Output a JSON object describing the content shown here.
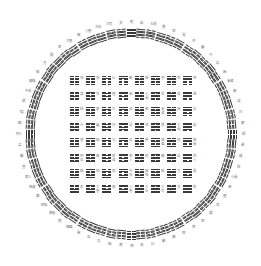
{
  "diagram": {
    "center": [
      131,
      134
    ],
    "ring_radius": 101,
    "label_radius": 112,
    "colors": {
      "line": "#3a3a3a",
      "label": "#777777",
      "background": "#ffffff"
    }
  },
  "hexagrams_fuxi": [
    {
      "name": "乾",
      "bits": "111111"
    },
    {
      "name": "夬",
      "bits": "111110"
    },
    {
      "name": "大有",
      "bits": "111101"
    },
    {
      "name": "大壯",
      "bits": "111100"
    },
    {
      "name": "小畜",
      "bits": "111011"
    },
    {
      "name": "需",
      "bits": "111010"
    },
    {
      "name": "大畜",
      "bits": "111001"
    },
    {
      "name": "泰",
      "bits": "111000"
    },
    {
      "name": "履",
      "bits": "110111"
    },
    {
      "name": "兌",
      "bits": "110110"
    },
    {
      "name": "睽",
      "bits": "110101"
    },
    {
      "name": "歸妹",
      "bits": "110100"
    },
    {
      "name": "中孚",
      "bits": "110011"
    },
    {
      "name": "節",
      "bits": "110010"
    },
    {
      "name": "損",
      "bits": "110001"
    },
    {
      "name": "臨",
      "bits": "110000"
    },
    {
      "name": "同人",
      "bits": "101111"
    },
    {
      "name": "革",
      "bits": "101110"
    },
    {
      "name": "離",
      "bits": "101101"
    },
    {
      "name": "豐",
      "bits": "101100"
    },
    {
      "name": "家人",
      "bits": "101011"
    },
    {
      "name": "既濟",
      "bits": "101010"
    },
    {
      "name": "賁",
      "bits": "101001"
    },
    {
      "name": "明夷",
      "bits": "101000"
    },
    {
      "name": "無妄",
      "bits": "100111"
    },
    {
      "name": "隨",
      "bits": "100110"
    },
    {
      "name": "噬嗑",
      "bits": "100101"
    },
    {
      "name": "震",
      "bits": "100100"
    },
    {
      "name": "益",
      "bits": "100011"
    },
    {
      "name": "屯",
      "bits": "100010"
    },
    {
      "name": "頤",
      "bits": "100001"
    },
    {
      "name": "復",
      "bits": "100000"
    },
    {
      "name": "姤",
      "bits": "011111"
    },
    {
      "name": "大過",
      "bits": "011110"
    },
    {
      "name": "鼎",
      "bits": "011101"
    },
    {
      "name": "恆",
      "bits": "011100"
    },
    {
      "name": "巽",
      "bits": "011011"
    },
    {
      "name": "井",
      "bits": "011010"
    },
    {
      "name": "蠱",
      "bits": "011001"
    },
    {
      "name": "升",
      "bits": "011000"
    },
    {
      "name": "訟",
      "bits": "010111"
    },
    {
      "name": "困",
      "bits": "010110"
    },
    {
      "name": "未濟",
      "bits": "010101"
    },
    {
      "name": "解",
      "bits": "010100"
    },
    {
      "name": "渙",
      "bits": "010011"
    },
    {
      "name": "坎",
      "bits": "010010"
    },
    {
      "name": "蒙",
      "bits": "010001"
    },
    {
      "name": "師",
      "bits": "010000"
    },
    {
      "name": "遯",
      "bits": "001111"
    },
    {
      "name": "咸",
      "bits": "001110"
    },
    {
      "name": "旅",
      "bits": "001101"
    },
    {
      "name": "小過",
      "bits": "001100"
    },
    {
      "name": "漸",
      "bits": "001011"
    },
    {
      "name": "蹇",
      "bits": "001010"
    },
    {
      "name": "艮",
      "bits": "001001"
    },
    {
      "name": "謙",
      "bits": "001000"
    },
    {
      "name": "否",
      "bits": "000111"
    },
    {
      "name": "萃",
      "bits": "000110"
    },
    {
      "name": "晉",
      "bits": "000101"
    },
    {
      "name": "豫",
      "bits": "000100"
    },
    {
      "name": "觀",
      "bits": "000011"
    },
    {
      "name": "比",
      "bits": "000010"
    },
    {
      "name": "剝",
      "bits": "000001"
    },
    {
      "name": "坤",
      "bits": "000000"
    }
  ]
}
